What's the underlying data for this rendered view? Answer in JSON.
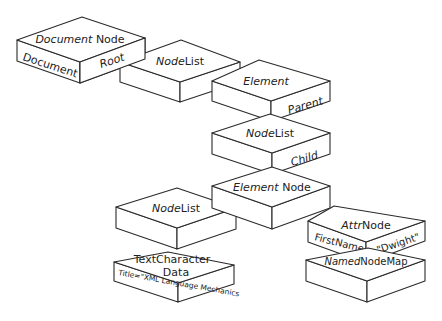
{
  "diagram": {
    "nodes": [
      {
        "id": "document-node",
        "top_italic": "Document",
        "top_regular": " Node",
        "left_side": "Document",
        "right_side": "Root"
      },
      {
        "id": "nodelist-1",
        "top_italic": "Node",
        "top_regular": "List"
      },
      {
        "id": "element-parent",
        "top_italic": "Element",
        "top_regular": "",
        "right_side": "Parent"
      },
      {
        "id": "nodelist-2",
        "top_italic": "Node",
        "top_regular": "List",
        "right_side": "Child"
      },
      {
        "id": "element-node",
        "top_italic": "Element",
        "top_regular": " Node"
      },
      {
        "id": "nodelist-3",
        "top_italic": "Node",
        "top_regular": "List"
      },
      {
        "id": "attr-node",
        "top_italic": "Attr",
        "top_regular": "Node",
        "left_side": "FirstName",
        "right_side": "= \"Dwight\""
      },
      {
        "id": "text-character-data",
        "top_line1": "TextCharacter",
        "top_line2": "Data",
        "side": "Title=\"XML Language Mechanics"
      },
      {
        "id": "named-node-map",
        "top_italic": "Named",
        "top_regular": "NodeMap"
      }
    ]
  }
}
